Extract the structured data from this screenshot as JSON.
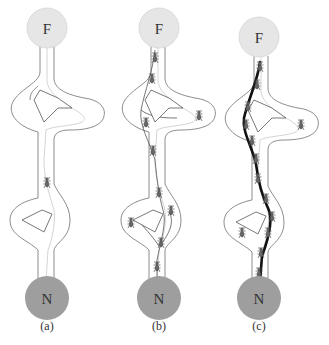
{
  "figure": {
    "nodes": {
      "food": {
        "label": "F",
        "color": "#e6e6e6"
      },
      "nest": {
        "label": "N",
        "color": "#9e9e9e"
      }
    },
    "panels": [
      {
        "id": "a",
        "label": "(a)",
        "ant_count": 1,
        "trail": "none"
      },
      {
        "id": "b",
        "label": "(b)",
        "ant_count": 10,
        "trail": "thin-multiple"
      },
      {
        "id": "c",
        "label": "(c)",
        "ant_count": 13,
        "trail": "thick-shortest"
      }
    ],
    "colors": {
      "corridor_outline": "#6e6e6e",
      "inner_path": "#cfcfcf",
      "pheromone_trail": "#111111"
    }
  }
}
